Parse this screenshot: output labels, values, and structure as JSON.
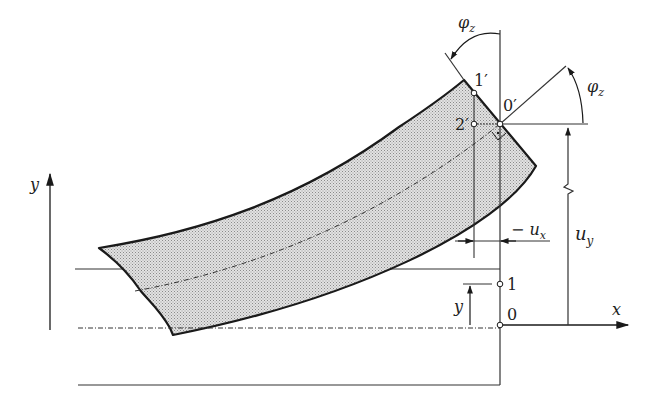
{
  "diagram": {
    "type": "beam-deflection",
    "colors": {
      "line": "#1a1a1a",
      "fill": "#cfcfcf",
      "background": "#ffffff"
    },
    "axes": {
      "x_label": "x",
      "y_label": "y"
    },
    "points": {
      "p0": "0",
      "p1": "1",
      "p0_prime": "0′",
      "p1_prime": "1′",
      "p2_prime": "2′"
    },
    "labels": {
      "phi_top": "φ",
      "phi_top_sub": "z",
      "phi_right": "φ",
      "phi_right_sub": "z",
      "ux_prefix": "− u",
      "ux_sub": "x",
      "uy": "u",
      "uy_sub": "y",
      "y_local": "y"
    }
  }
}
